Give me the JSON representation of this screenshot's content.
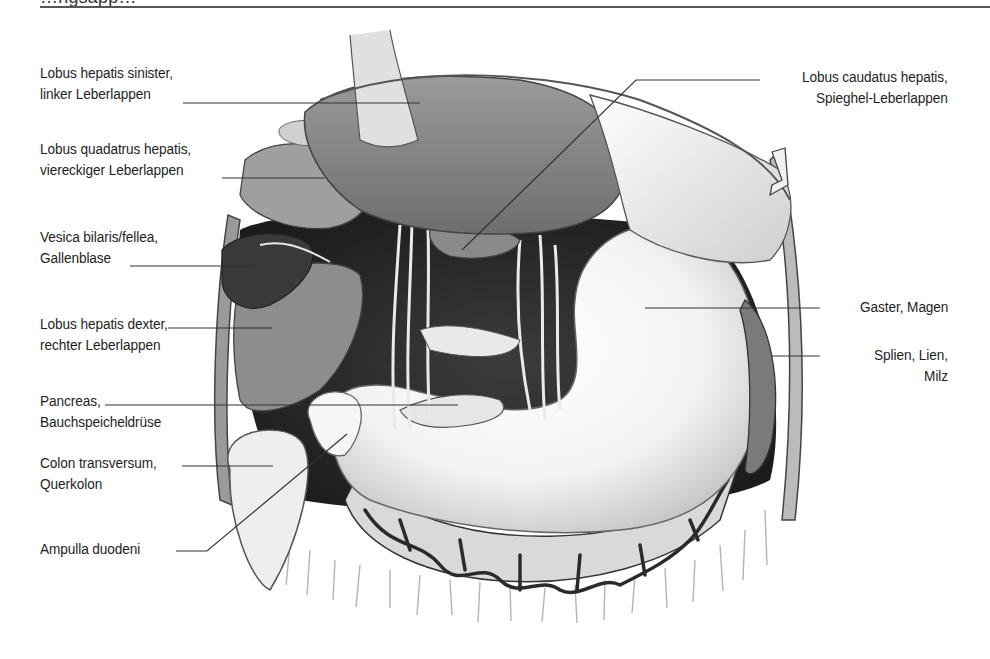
{
  "figure": {
    "header_partial": "…ngsapp…",
    "colors": {
      "background": "#ffffff",
      "label_text": "#1e1e1e",
      "leader_line": "#333333",
      "liver": "#7d7d7d",
      "gallbladder": "#3a3a3a",
      "stomach": "#f4f4f4",
      "vessels": "#2a2a2a"
    },
    "labels": {
      "lobus_sinister": {
        "line1": "Lobus hepatis sinister,",
        "line2": "linker Leberlappen"
      },
      "lobus_quadratus": {
        "line1": "Lobus quadatrus hepatis,",
        "line2": "viereckiger Leberlappen"
      },
      "vesica": {
        "line1": "Vesica bilaris/fellea,",
        "line2": "Gallenblase"
      },
      "lobus_dexter": {
        "line1": "Lobus hepatis dexter,",
        "line2": "rechter Leberlappen"
      },
      "pancreas": {
        "line1": "Pancreas,",
        "line2": "Bauchspeicheldrüse"
      },
      "colon": {
        "line1": "Colon transversum,",
        "line2": "Querkolon"
      },
      "ampulla": {
        "line1": "Ampulla duodeni"
      },
      "lobus_caudatus": {
        "line1": "Lobus caudatus hepatis,",
        "line2": "Spieghel-Leberlappen"
      },
      "gaster": {
        "line1": "Gaster, Magen"
      },
      "splien": {
        "line1": "Splien, Lien,",
        "line2": "Milz"
      }
    }
  }
}
